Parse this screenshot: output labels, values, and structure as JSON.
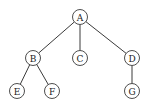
{
  "diagram": {
    "type": "tree",
    "node_radius": 7.5,
    "colors": {
      "stroke": "#3a3a3a",
      "text": "#222222",
      "background": "#ffffff"
    },
    "nodes": [
      {
        "id": "A",
        "label": "A",
        "x": 80,
        "y": 17
      },
      {
        "id": "B",
        "label": "B",
        "x": 33,
        "y": 58
      },
      {
        "id": "C",
        "label": "C",
        "x": 80,
        "y": 58
      },
      {
        "id": "D",
        "label": "D",
        "x": 132,
        "y": 58
      },
      {
        "id": "E",
        "label": "E",
        "x": 17,
        "y": 91
      },
      {
        "id": "F",
        "label": "F",
        "x": 52,
        "y": 91
      },
      {
        "id": "G",
        "label": "G",
        "x": 132,
        "y": 91
      }
    ],
    "edges": [
      {
        "from": "A",
        "to": "B"
      },
      {
        "from": "A",
        "to": "C"
      },
      {
        "from": "A",
        "to": "D"
      },
      {
        "from": "B",
        "to": "E"
      },
      {
        "from": "B",
        "to": "F"
      },
      {
        "from": "D",
        "to": "G"
      }
    ]
  }
}
